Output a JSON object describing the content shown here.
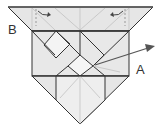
{
  "diagram": {
    "type": "origami folding step",
    "labels": {
      "a": "A",
      "b": "B"
    },
    "colors": {
      "paper_fill": "#e4e4e4",
      "paper_light": "#f2f2f2",
      "edge": "#333333",
      "crease": "#b0b0b0",
      "arrow": "#555555"
    }
  }
}
